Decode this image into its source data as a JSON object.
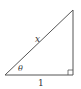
{
  "diagram": {
    "type": "right-triangle",
    "labels": {
      "hypotenuse": "x",
      "angle": "θ",
      "base": "1"
    },
    "right_angle_marker": true,
    "colors": {
      "stroke": "#555555",
      "text": "#333333",
      "background": "#ffffff"
    }
  }
}
